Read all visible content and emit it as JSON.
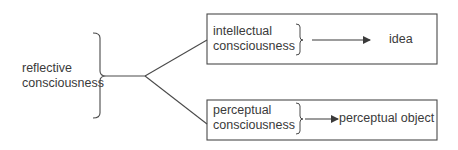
{
  "diagram": {
    "root": {
      "line1": "reflective",
      "line2": "consciousness"
    },
    "branches": [
      {
        "source": {
          "line1": "intellectual",
          "line2": "consciousness"
        },
        "target": "idea"
      },
      {
        "source": {
          "line1": "perceptual",
          "line2": "consciousness"
        },
        "target": "perceptual object"
      }
    ],
    "colors": {
      "stroke": "#4a4a4a",
      "text": "#3a3a3a",
      "background": "#ffffff"
    }
  }
}
